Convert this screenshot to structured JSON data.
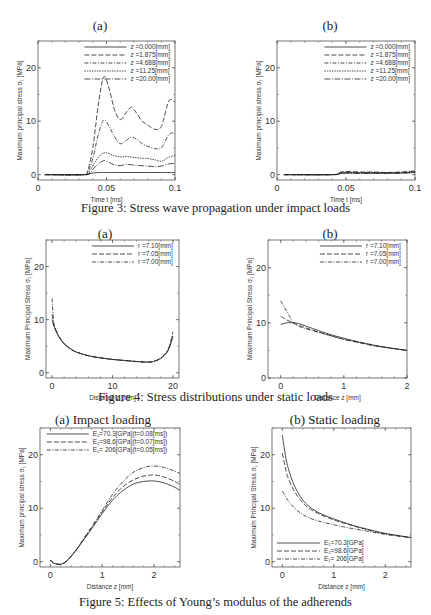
{
  "captions": {
    "fig3": "Figure 3: Stress wave propagation under impact loads",
    "fig4": "Figure 4: Stress distributions under static loads",
    "fig5": "Figure 5: Effects of Young’s modulus of the adherends"
  },
  "chart_data": [
    {
      "id": "fig3a",
      "type": "line",
      "title": "(a)",
      "xlabel": "Time t [ms]",
      "ylabel": "Maximum principal stress σ₁ [MPa]",
      "xlim": [
        0,
        0.1
      ],
      "ylim": [
        -1,
        25
      ],
      "xticks": [
        0,
        0.05,
        0.1
      ],
      "xtick_labels": [
        "0",
        "0.05",
        "0.1"
      ],
      "yticks": [
        0,
        10,
        20
      ],
      "legend_position": "upper right",
      "series": [
        {
          "name": "z =0.000[mm]",
          "dash": "",
          "x": [
            0.005,
            0.03,
            0.034,
            0.04,
            0.045,
            0.05,
            0.06,
            0.07,
            0.08,
            0.09,
            0.1
          ],
          "y": [
            0,
            0,
            0,
            0.3,
            0.4,
            0.4,
            0.4,
            0.4,
            0.4,
            0.4,
            0.4
          ]
        },
        {
          "name": "z =1.875[mm]",
          "dash": "5,2",
          "x": [
            0.005,
            0.033,
            0.036,
            0.04,
            0.044,
            0.048,
            0.052,
            0.056,
            0.06,
            0.064,
            0.068,
            0.072,
            0.076,
            0.08,
            0.085,
            0.09,
            0.095,
            0.098,
            0.1
          ],
          "y": [
            0,
            0,
            0.5,
            5,
            13,
            18.3,
            16,
            12,
            10.3,
            11.5,
            12.6,
            11.5,
            10,
            9.3,
            8.5,
            9,
            13.5,
            14,
            13.5
          ]
        },
        {
          "name": "z =4.688[mm]",
          "dash": "4,1.5,1,1.5",
          "x": [
            0.005,
            0.033,
            0.036,
            0.04,
            0.044,
            0.048,
            0.052,
            0.056,
            0.06,
            0.064,
            0.068,
            0.072,
            0.076,
            0.08,
            0.085,
            0.09,
            0.095,
            0.098,
            0.1
          ],
          "y": [
            0,
            0,
            0.3,
            3,
            7.5,
            10.2,
            9,
            7,
            5.8,
            6.3,
            7,
            6.6,
            5.8,
            5.3,
            4.9,
            5,
            7.3,
            7.8,
            7.6
          ]
        },
        {
          "name": "z =11.25[mm]",
          "dash": "1.5,1",
          "x": [
            0.005,
            0.034,
            0.038,
            0.042,
            0.046,
            0.05,
            0.055,
            0.06,
            0.065,
            0.07,
            0.075,
            0.08,
            0.085,
            0.09,
            0.095,
            0.1
          ],
          "y": [
            0,
            0,
            0.8,
            2.5,
            3.8,
            4.1,
            3.6,
            3.3,
            3.4,
            3.2,
            3.1,
            3,
            2.8,
            2.5,
            3.2,
            3.6
          ]
        },
        {
          "name": "z =20.00[mm]",
          "dash": "6,1.5,1,1.5",
          "x": [
            0.005,
            0.035,
            0.04,
            0.044,
            0.048,
            0.052,
            0.056,
            0.06,
            0.065,
            0.07,
            0.075,
            0.08,
            0.085,
            0.09,
            0.095,
            0.1
          ],
          "y": [
            0,
            0,
            1,
            2,
            2.6,
            2.3,
            1.8,
            1.7,
            1.9,
            1.8,
            1.7,
            1.6,
            1.5,
            1.6,
            2,
            2.1
          ]
        }
      ]
    },
    {
      "id": "fig3b",
      "type": "line",
      "title": "(b)",
      "xlabel": "Time t [ms]",
      "ylabel": "Maximum principal stress σ₁ [MPa]",
      "xlim": [
        0,
        0.1
      ],
      "ylim": [
        -1,
        25
      ],
      "xticks": [
        0,
        0.05,
        0.1
      ],
      "xtick_labels": [
        "0",
        "0.05",
        "0.1"
      ],
      "yticks": [
        0,
        10,
        20
      ],
      "legend_position": "upper right",
      "series": [
        {
          "name": "z =0.000[mm]",
          "dash": "",
          "x": [
            0.005,
            0.04,
            0.045,
            0.05,
            0.06,
            0.07,
            0.08,
            0.09,
            0.1
          ],
          "y": [
            0,
            0,
            0.2,
            0.3,
            0.3,
            0.3,
            0.3,
            0.3,
            0.4
          ]
        },
        {
          "name": "z =1.875[mm]",
          "dash": "5,2",
          "x": [
            0.005,
            0.04,
            0.045,
            0.05,
            0.06,
            0.07,
            0.08,
            0.09,
            0.1
          ],
          "y": [
            0,
            0,
            0.4,
            0.6,
            0.5,
            0.5,
            0.4,
            0.5,
            0.7
          ]
        },
        {
          "name": "z =4.688[mm]",
          "dash": "4,1.5,1,1.5",
          "x": [
            0.005,
            0.04,
            0.045,
            0.05,
            0.06,
            0.07,
            0.08,
            0.09,
            0.1
          ],
          "y": [
            0,
            0,
            0.3,
            0.5,
            0.4,
            0.4,
            0.35,
            0.4,
            0.6
          ]
        },
        {
          "name": "z =11.25[mm]",
          "dash": "1.5,1",
          "x": [
            0.005,
            0.04,
            0.045,
            0.05,
            0.06,
            0.07,
            0.08,
            0.09,
            0.1
          ],
          "y": [
            0,
            0,
            0.2,
            0.4,
            0.3,
            0.3,
            0.3,
            0.35,
            0.5
          ]
        },
        {
          "name": "z =20.00[mm]",
          "dash": "6,1.5,1,1.5",
          "x": [
            0.005,
            0.04,
            0.045,
            0.05,
            0.06,
            0.07,
            0.08,
            0.09,
            0.1
          ],
          "y": [
            0,
            0,
            0.1,
            0.3,
            0.25,
            0.25,
            0.25,
            0.3,
            0.4
          ]
        }
      ]
    },
    {
      "id": "fig4a",
      "type": "line",
      "title": "(a)",
      "xlabel": "Distance z [mm]",
      "ylabel": "Maximum Principal Stress σ₁ [MPa]",
      "xlim": [
        -1,
        21
      ],
      "ylim": [
        -1,
        25
      ],
      "xticks": [
        0,
        10,
        20
      ],
      "xtick_labels": [
        "0",
        "10",
        "20"
      ],
      "yticks": [
        0,
        10,
        20
      ],
      "legend_position": "upper right",
      "series": [
        {
          "name": "r =7.10[mm]",
          "dash": "",
          "x": [
            0,
            0.3,
            0.7,
            1.2,
            2,
            3,
            4,
            6,
            8,
            10,
            12,
            14,
            16,
            17,
            18,
            19,
            19.5,
            20
          ],
          "y": [
            10,
            8.8,
            7.7,
            6.6,
            5.4,
            4.5,
            3.9,
            3.2,
            2.8,
            2.5,
            2.3,
            2.1,
            2,
            2.2,
            2.7,
            3.8,
            5,
            6.8
          ]
        },
        {
          "name": "r =7.05[mm]",
          "dash": "5,2",
          "x": [
            0,
            0.3,
            0.7,
            1.2,
            2,
            3,
            4,
            6,
            8,
            10,
            12,
            14,
            16,
            17,
            18,
            19,
            19.5,
            20
          ],
          "y": [
            11,
            9,
            7.8,
            6.7,
            5.5,
            4.5,
            3.9,
            3.2,
            2.8,
            2.5,
            2.3,
            2.1,
            2,
            2.2,
            2.7,
            3.9,
            5.2,
            7.2
          ]
        },
        {
          "name": "r =7.00[mm]",
          "dash": "4,1.5,1,1.5",
          "x": [
            0,
            0.3,
            0.7,
            1.2,
            2,
            3,
            4,
            6,
            8,
            10,
            12,
            14,
            16,
            17,
            18,
            19,
            19.5,
            20
          ],
          "y": [
            14,
            9.3,
            7.9,
            6.8,
            5.5,
            4.6,
            3.9,
            3.2,
            2.8,
            2.5,
            2.3,
            2.1,
            2,
            2.2,
            2.8,
            4,
            5.4,
            7.7
          ]
        }
      ]
    },
    {
      "id": "fig4b",
      "type": "line",
      "title": "(b)",
      "xlabel": "Distance z [mm]",
      "ylabel": "Maximum Principal Stress σ₁ [MPa]",
      "xlim": [
        -0.2,
        2
      ],
      "ylim": [
        0,
        25
      ],
      "xticks": [
        0,
        1,
        2
      ],
      "xtick_labels": [
        "0",
        "1",
        "2"
      ],
      "yticks": [
        0,
        10,
        20
      ],
      "legend_position": "upper right",
      "series": [
        {
          "name": "r =7.10[mm]",
          "dash": "",
          "x": [
            0,
            0.1,
            0.2,
            0.3,
            0.5,
            0.75,
            1,
            1.25,
            1.5,
            1.75,
            2
          ],
          "y": [
            9.7,
            10,
            10,
            9.8,
            9,
            8,
            7.2,
            6.5,
            5.9,
            5.4,
            5
          ]
        },
        {
          "name": "r =7.05[mm]",
          "dash": "5,2",
          "x": [
            0,
            0.1,
            0.2,
            0.3,
            0.5,
            0.75,
            1,
            1.25,
            1.5,
            1.75,
            2
          ],
          "y": [
            11.2,
            10.5,
            10,
            9.5,
            8.7,
            7.8,
            7,
            6.4,
            5.8,
            5.4,
            5
          ]
        },
        {
          "name": "r =7.00[mm]",
          "dash": "4,1.5,1,1.5",
          "x": [
            0,
            0.05,
            0.1,
            0.15,
            0.2,
            0.3,
            0.5,
            0.75,
            1,
            1.25,
            1.5,
            1.75,
            2
          ],
          "y": [
            14,
            13,
            12,
            11,
            10,
            9.3,
            8.6,
            7.8,
            7,
            6.4,
            5.8,
            5.4,
            5
          ]
        }
      ]
    },
    {
      "id": "fig5a",
      "type": "line",
      "title": "(a) Impact loading",
      "xlabel": "Distance z [mm]",
      "ylabel": "Maximum principal stress σ₁ [MPa]",
      "xlim": [
        -0.2,
        2.5
      ],
      "ylim": [
        -1,
        25
      ],
      "xticks": [
        0,
        1,
        2
      ],
      "xtick_labels": [
        "0",
        "1",
        "2"
      ],
      "yticks": [
        0,
        10,
        20
      ],
      "legend_position": "upper right",
      "series": [
        {
          "name": "E₁=70.3[GPa](t=0.08[ms])",
          "dash": "",
          "x": [
            0,
            0.05,
            0.1,
            0.2,
            0.3,
            0.4,
            0.5,
            0.6,
            0.8,
            1,
            1.2,
            1.4,
            1.6,
            1.8,
            2,
            2.2,
            2.4,
            2.5
          ],
          "y": [
            0.3,
            -0.2,
            -0.4,
            -0.5,
            0,
            1,
            2.2,
            3.5,
            6.2,
            9,
            11.5,
            13.3,
            14.5,
            15,
            15.1,
            14.7,
            13.9,
            13.3
          ]
        },
        {
          "name": "E₁=98.6[GPa](t=0.07[ms])",
          "dash": "5,2",
          "x": [
            0,
            0.05,
            0.1,
            0.2,
            0.3,
            0.4,
            0.5,
            0.6,
            0.8,
            1,
            1.2,
            1.4,
            1.6,
            1.8,
            2,
            2.2,
            2.4,
            2.5
          ],
          "y": [
            0.3,
            -0.2,
            -0.4,
            -0.5,
            0,
            1,
            2.2,
            3.6,
            6.4,
            9.3,
            12,
            14,
            15.3,
            16,
            16.2,
            15.8,
            15,
            14.4
          ]
        },
        {
          "name": "E₁= 206[GPa](t=0.05[ms])",
          "dash": "4,1.5,1,1.5",
          "x": [
            0,
            0.05,
            0.1,
            0.2,
            0.3,
            0.4,
            0.5,
            0.6,
            0.8,
            1,
            1.2,
            1.4,
            1.6,
            1.8,
            2,
            2.2,
            2.4,
            2.5
          ],
          "y": [
            0.3,
            -0.2,
            -0.4,
            -0.5,
            0,
            1,
            2.2,
            3.7,
            6.6,
            9.6,
            12.6,
            15,
            16.7,
            17.6,
            17.9,
            17.6,
            16.9,
            16.5
          ]
        }
      ]
    },
    {
      "id": "fig5b",
      "type": "line",
      "title": "(b) Static loading",
      "xlabel": "Distance z [mm]",
      "ylabel": "Maximum Principal Stress σ₁ [MPa]",
      "xlim": [
        -0.2,
        2.5
      ],
      "ylim": [
        -1,
        25
      ],
      "xticks": [
        0,
        1,
        2
      ],
      "xtick_labels": [
        "0",
        "1",
        "2"
      ],
      "yticks": [
        0,
        10,
        20
      ],
      "legend_position": "lower left",
      "series": [
        {
          "name": "E₁=70.3[GPa]",
          "dash": "",
          "x": [
            0,
            0.05,
            0.1,
            0.2,
            0.3,
            0.4,
            0.5,
            0.7,
            1,
            1.3,
            1.6,
            2,
            2.5
          ],
          "y": [
            23.7,
            20.5,
            18,
            15,
            13,
            11.5,
            10.5,
            9.2,
            8,
            7,
            6.2,
            5.3,
            4.5
          ]
        },
        {
          "name": "E₁=98.6[GPa]",
          "dash": "5,2",
          "x": [
            0,
            0.05,
            0.1,
            0.2,
            0.3,
            0.4,
            0.5,
            0.7,
            1,
            1.3,
            1.6,
            2,
            2.5
          ],
          "y": [
            20.3,
            18,
            16,
            13.8,
            12.2,
            11,
            10.1,
            9,
            7.8,
            6.9,
            6.1,
            5.2,
            4.5
          ]
        },
        {
          "name": "E₁= 206[GPa]",
          "dash": "4,1.5,1,1.5",
          "x": [
            0,
            0.05,
            0.1,
            0.2,
            0.3,
            0.4,
            0.5,
            0.7,
            1,
            1.3,
            1.6,
            2,
            2.5
          ],
          "y": [
            13.2,
            12.4,
            11.6,
            10.4,
            9.5,
            8.8,
            8.3,
            7.6,
            6.9,
            6.3,
            5.8,
            5.1,
            4.5
          ]
        }
      ]
    }
  ],
  "layout": [
    {
      "chart": 0,
      "left": 38,
      "top": 41,
      "width": 137,
      "height": 139,
      "title_x": 100,
      "title_y": 18
    },
    {
      "chart": 1,
      "left": 277,
      "top": 41,
      "width": 138,
      "height": 139,
      "title_x": 330,
      "title_y": 18
    },
    {
      "chart": 2,
      "left": 46,
      "top": 240,
      "width": 133,
      "height": 138,
      "title_x": 105,
      "title_y": 226
    },
    {
      "chart": 3,
      "left": 268,
      "top": 240,
      "width": 139,
      "height": 138,
      "title_x": 330,
      "title_y": 226
    },
    {
      "chart": 4,
      "left": 40,
      "top": 428,
      "width": 140,
      "height": 139,
      "title_x": 103,
      "title_y": 412
    },
    {
      "chart": 5,
      "left": 272,
      "top": 428,
      "width": 139,
      "height": 139,
      "title_x": 335,
      "title_y": 412
    }
  ]
}
